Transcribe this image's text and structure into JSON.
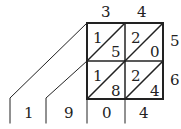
{
  "diagram": {
    "type": "lattice-multiplication",
    "top_digits": [
      "3",
      "4"
    ],
    "right_digits": [
      "5",
      "6"
    ],
    "cells": [
      [
        {
          "tens": "1",
          "ones": "5"
        },
        {
          "tens": "2",
          "ones": "0"
        }
      ],
      [
        {
          "tens": "1",
          "ones": "8"
        },
        {
          "tens": "2",
          "ones": "4"
        }
      ]
    ],
    "result_digits": [
      "1",
      "9",
      "0",
      "4"
    ]
  }
}
